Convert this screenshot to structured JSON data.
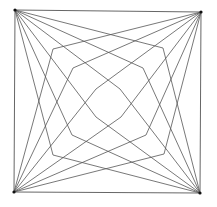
{
  "diagram": {
    "type": "string-art-geometric-figure",
    "stroke_color": "#555555",
    "corner_color": "#111111",
    "background": "#ffffff",
    "square": {
      "tl": [
        15,
        10
      ],
      "tr": [
        201,
        12
      ],
      "br": [
        200,
        193
      ],
      "bl": [
        14,
        192
      ]
    },
    "levels": [
      {
        "name": "outer",
        "vertices": [
          [
            53,
            49
          ],
          [
            163,
            48
          ],
          [
            164,
            154
          ],
          [
            53,
            155
          ]
        ]
      },
      {
        "name": "middle",
        "vertices": [
          [
            73,
            68
          ],
          [
            143,
            68
          ],
          [
            146,
            135
          ],
          [
            72,
            135
          ]
        ]
      },
      {
        "name": "inner",
        "vertices": [
          [
            96,
            89
          ],
          [
            120,
            89
          ],
          [
            121,
            117
          ],
          [
            96,
            117
          ]
        ]
      }
    ]
  }
}
